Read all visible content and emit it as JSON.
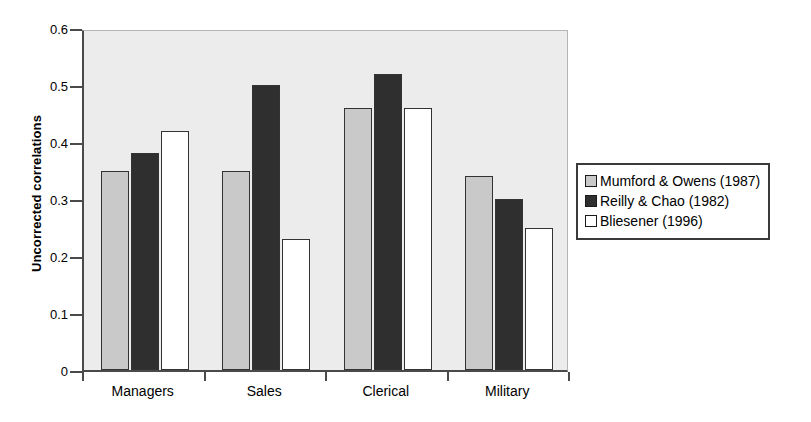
{
  "chart_data": {
    "type": "bar",
    "title": "",
    "subtitle": "",
    "xlabel": "",
    "ylabel": "Uncorrected correlations",
    "categories": [
      "Managers",
      "Sales",
      "Clerical",
      "Military"
    ],
    "series": [
      {
        "name": "Mumford & Owens (1987)",
        "color": "#c9c9c9",
        "values": [
          0.35,
          0.35,
          0.46,
          0.34
        ]
      },
      {
        "name": "Reilly & Chao (1982)",
        "color": "#2f2f2f",
        "values": [
          0.38,
          0.5,
          0.52,
          0.3
        ]
      },
      {
        "name": "Bliesener (1996)",
        "color": "#ffffff",
        "values": [
          0.42,
          0.23,
          0.46,
          0.25
        ]
      }
    ],
    "ylim": [
      0,
      0.6
    ],
    "ytick_labels": [
      "0",
      "0.1",
      "0.2",
      "0.3",
      "0.4",
      "0.5",
      "0.6"
    ],
    "ytick_values": [
      0,
      0.1,
      0.2,
      0.3,
      0.4,
      0.5,
      0.6
    ],
    "grid": false,
    "legend_position": "right",
    "plot_background": "#ececec",
    "axis_color": "#4a4a4a",
    "bar_border_color": "#333333"
  },
  "legend": {
    "entries": [
      {
        "label": "Mumford & Owens (1987)"
      },
      {
        "label": "Reilly & Chao (1982)"
      },
      {
        "label": "Bliesener (1996)"
      }
    ]
  }
}
